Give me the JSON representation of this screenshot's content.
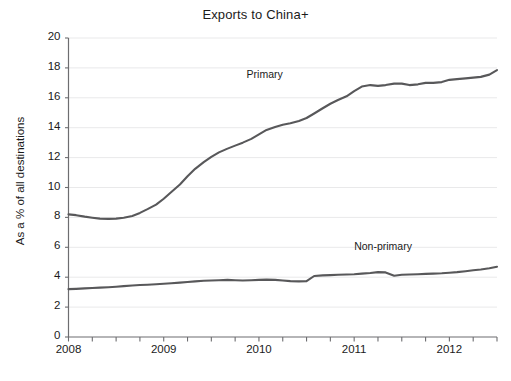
{
  "chart_data": {
    "type": "line",
    "title": "Exports to China+",
    "xlabel": "",
    "ylabel": "As a % of all destinations",
    "xlim": [
      2008.0,
      2012.5
    ],
    "ylim": [
      0,
      20
    ],
    "yticks": [
      0,
      2,
      4,
      6,
      8,
      10,
      12,
      14,
      16,
      18,
      20
    ],
    "xticks": [
      2008,
      2009,
      2010,
      2011,
      2012
    ],
    "xtick_labels": [
      "2008",
      "2009",
      "2010",
      "2011",
      "2012"
    ],
    "xminor_step": 0.25,
    "grid": "horizontal",
    "legend_position": "inline-annotations",
    "line_color": "#58585a",
    "grid_color": "#e9e9ea",
    "axis_color": "#6d6d70",
    "series": [
      {
        "name": "Primary",
        "label_x": 2009.87,
        "label_y": 17.55,
        "x": [
          2008.0,
          2008.08,
          2008.17,
          2008.25,
          2008.33,
          2008.42,
          2008.5,
          2008.58,
          2008.67,
          2008.75,
          2008.83,
          2008.92,
          2009.0,
          2009.08,
          2009.17,
          2009.25,
          2009.33,
          2009.42,
          2009.5,
          2009.58,
          2009.67,
          2009.75,
          2009.83,
          2009.92,
          2010.0,
          2010.08,
          2010.17,
          2010.25,
          2010.33,
          2010.42,
          2010.5,
          2010.58,
          2010.67,
          2010.75,
          2010.83,
          2010.92,
          2011.0,
          2011.08,
          2011.17,
          2011.25,
          2011.33,
          2011.42,
          2011.5,
          2011.58,
          2011.67,
          2011.75,
          2011.83,
          2011.92,
          2012.0,
          2012.08,
          2012.17,
          2012.25,
          2012.33,
          2012.42,
          2012.5
        ],
        "y": [
          8.2,
          8.15,
          8.05,
          7.98,
          7.92,
          7.9,
          7.92,
          7.98,
          8.1,
          8.3,
          8.55,
          8.85,
          9.25,
          9.7,
          10.2,
          10.75,
          11.25,
          11.7,
          12.05,
          12.35,
          12.6,
          12.8,
          13.0,
          13.25,
          13.55,
          13.85,
          14.05,
          14.2,
          14.3,
          14.45,
          14.65,
          14.95,
          15.3,
          15.6,
          15.85,
          16.1,
          16.45,
          16.75,
          16.85,
          16.8,
          16.85,
          16.95,
          16.95,
          16.85,
          16.9,
          17.0,
          17.0,
          17.05,
          17.2,
          17.25,
          17.3,
          17.35,
          17.4,
          17.55,
          17.85
        ]
      },
      {
        "name": "Non-primary",
        "label_x": 2011.0,
        "label_y": 6.05,
        "x": [
          2008.0,
          2008.08,
          2008.17,
          2008.25,
          2008.33,
          2008.42,
          2008.5,
          2008.58,
          2008.67,
          2008.75,
          2008.83,
          2008.92,
          2009.0,
          2009.08,
          2009.17,
          2009.25,
          2009.33,
          2009.42,
          2009.5,
          2009.58,
          2009.67,
          2009.75,
          2009.83,
          2009.92,
          2010.0,
          2010.08,
          2010.17,
          2010.25,
          2010.33,
          2010.42,
          2010.5,
          2010.58,
          2010.67,
          2010.75,
          2010.83,
          2010.92,
          2011.0,
          2011.08,
          2011.17,
          2011.25,
          2011.33,
          2011.42,
          2011.5,
          2011.58,
          2011.67,
          2011.75,
          2011.83,
          2011.92,
          2012.0,
          2012.08,
          2012.17,
          2012.25,
          2012.33,
          2012.42,
          2012.5
        ],
        "y": [
          3.2,
          3.22,
          3.25,
          3.28,
          3.3,
          3.33,
          3.36,
          3.4,
          3.44,
          3.48,
          3.5,
          3.53,
          3.56,
          3.6,
          3.64,
          3.68,
          3.72,
          3.76,
          3.78,
          3.8,
          3.82,
          3.8,
          3.78,
          3.8,
          3.82,
          3.84,
          3.82,
          3.78,
          3.74,
          3.72,
          3.74,
          4.08,
          4.12,
          4.14,
          4.16,
          4.18,
          4.2,
          4.24,
          4.28,
          4.34,
          4.32,
          4.1,
          4.16,
          4.18,
          4.2,
          4.22,
          4.24,
          4.26,
          4.3,
          4.34,
          4.4,
          4.46,
          4.52,
          4.6,
          4.7
        ]
      }
    ]
  }
}
